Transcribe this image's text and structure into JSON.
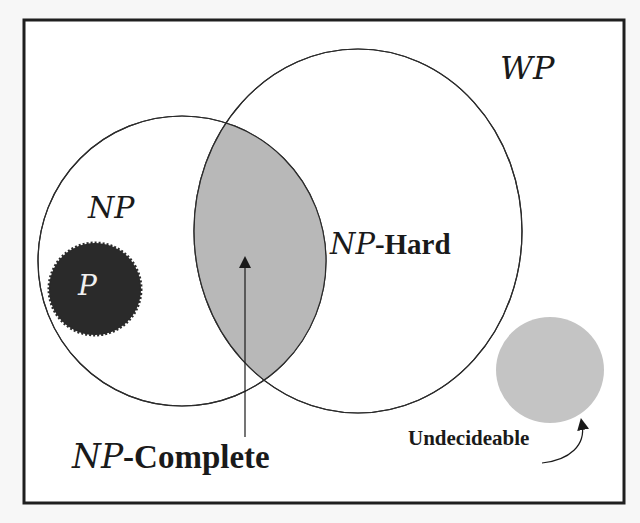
{
  "diagram": {
    "frame_label": "WP",
    "sets": [
      {
        "id": "np",
        "label": "NP",
        "fill": "#ffffff"
      },
      {
        "id": "np_hard",
        "label_prefix": "NP",
        "label_suffix": "-Hard",
        "fill": "#ffffff"
      },
      {
        "id": "np_complete",
        "label_prefix": "NP",
        "label_suffix": "-Complete",
        "fill": "#b8b8b8"
      },
      {
        "id": "p",
        "label": "P",
        "fill": "#2a2a2a"
      },
      {
        "id": "undecidable",
        "label": "Undecideable",
        "fill": "#c4c4c4"
      }
    ],
    "colors": {
      "background": "#f7f7f7",
      "stroke": "#2b2b2b",
      "np_complete_fill": "#b8b8b8",
      "p_fill": "#2a2a2a",
      "undecidable_fill": "#c4c4c4"
    }
  }
}
